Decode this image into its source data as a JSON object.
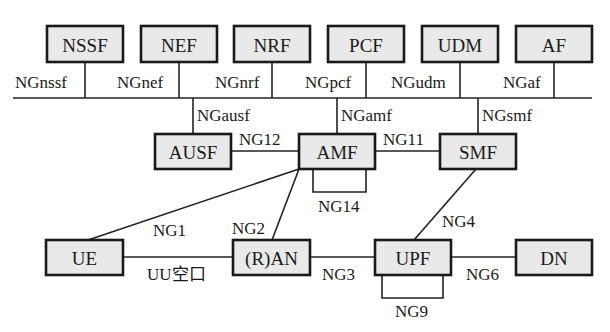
{
  "colors": {
    "box_fill": "#e9e9e9",
    "stroke": "#1a1a1a",
    "background": "#ffffff"
  },
  "nodes": {
    "nssf": {
      "label": "NSSF",
      "x": 47,
      "y": 26,
      "w": 76,
      "h": 36
    },
    "nef": {
      "label": "NEF",
      "x": 141,
      "y": 26,
      "w": 76,
      "h": 36
    },
    "nrf": {
      "label": "NRF",
      "x": 234,
      "y": 26,
      "w": 76,
      "h": 36
    },
    "pcf": {
      "label": "PCF",
      "x": 328,
      "y": 26,
      "w": 76,
      "h": 36
    },
    "udm": {
      "label": "UDM",
      "x": 422,
      "y": 26,
      "w": 76,
      "h": 36
    },
    "af": {
      "label": "AF",
      "x": 516,
      "y": 26,
      "w": 76,
      "h": 36
    },
    "ausf": {
      "label": "AUSF",
      "x": 155,
      "y": 134,
      "w": 76,
      "h": 35
    },
    "amf": {
      "label": "AMF",
      "x": 299,
      "y": 134,
      "w": 76,
      "h": 35
    },
    "smf": {
      "label": "SMF",
      "x": 440,
      "y": 134,
      "w": 76,
      "h": 35
    },
    "ue": {
      "label": "UE",
      "x": 46,
      "y": 240,
      "w": 77,
      "h": 35
    },
    "ran": {
      "label": "(R)AN",
      "x": 233,
      "y": 240,
      "w": 77,
      "h": 35
    },
    "upf": {
      "label": "UPF",
      "x": 375,
      "y": 240,
      "w": 76,
      "h": 35
    },
    "dn": {
      "label": "DN",
      "x": 516,
      "y": 240,
      "w": 76,
      "h": 35
    }
  },
  "interfaces": {
    "ngnssf": "NGnssf",
    "ngnef": "NGnef",
    "ngnrf": "NGnrf",
    "ngpcf": "NGpcf",
    "ngudm": "NGudm",
    "ngaf": "NGaf",
    "ngausf": "NGausf",
    "ngamf": "NGamf",
    "ngsmf": "NGsmf",
    "ng12": "NG12",
    "ng11": "NG11",
    "ng14": "NG14",
    "ng1": "NG1",
    "ng2": "NG2",
    "ng4": "NG4",
    "uu": "UU空口",
    "ng3": "NG3",
    "ng6": "NG6",
    "ng9": "NG9"
  }
}
